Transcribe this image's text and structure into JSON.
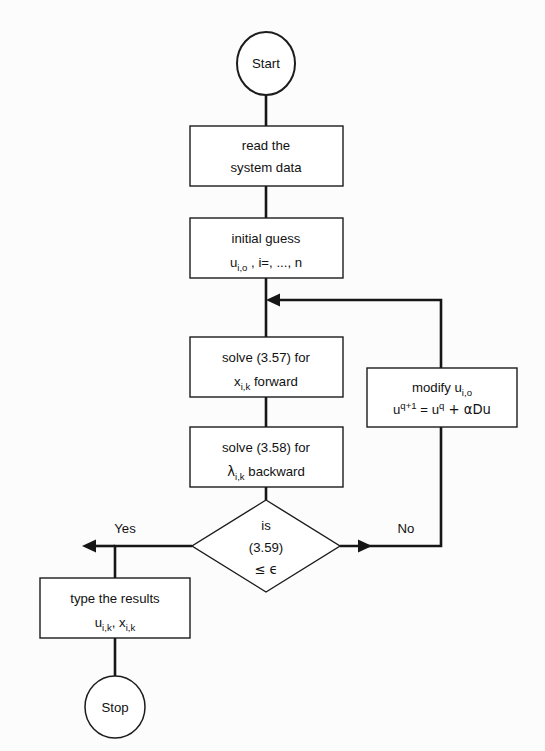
{
  "diagram": {
    "background_color": "#fcfcfc",
    "line_color": "#161616",
    "shape_fill": "#ffffff"
  },
  "nodes": {
    "start": {
      "label": "Start",
      "shape": "ellipse"
    },
    "read_data": {
      "line1": "read the",
      "line2": "system data",
      "shape": "rectangle"
    },
    "initial_guess": {
      "line1": "initial guess",
      "line2_u": "u",
      "line2_u_sub": "i,o",
      "line2_rest": " , i=, ..., n",
      "shape": "rectangle"
    },
    "solve_forward": {
      "line1": "solve (3.57) for",
      "line2_var": "x",
      "line2_sub": "i,k",
      "line2_rest": " forward",
      "shape": "rectangle"
    },
    "solve_backward": {
      "line1": "solve (3.58) for",
      "line2_var": "λ",
      "line2_sub": "i,k",
      "line2_rest": " backward",
      "shape": "rectangle"
    },
    "modify": {
      "line1_text": "modify u",
      "line1_sub": "i,o",
      "line2_u": "u",
      "line2_sup": "q+1",
      "line2_eq": " = u",
      "line2_sup2": "q",
      "line2_tail": " + αDu",
      "shape": "rectangle"
    },
    "decision": {
      "line1": "is",
      "line2": "(3.59)",
      "line3": "≤ ϵ",
      "shape": "diamond"
    },
    "type_results": {
      "line1": "type the results",
      "line2_u": "u",
      "line2_u_sub": "i,k",
      "line2_mid": ", x",
      "line2_x_sub": "i,k",
      "shape": "rectangle"
    },
    "stop": {
      "label": "Stop",
      "shape": "ellipse"
    }
  },
  "edges": {
    "yes_label": "Yes",
    "no_label": "No"
  }
}
